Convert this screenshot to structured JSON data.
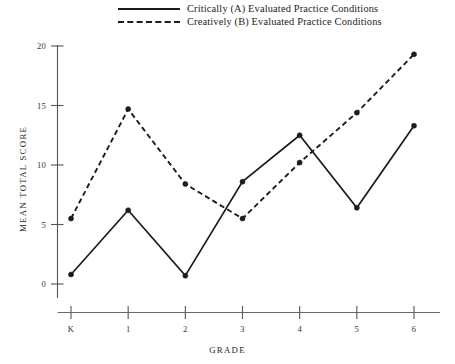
{
  "figure": {
    "background_color": "#ffffff",
    "ink_color": "#1c1c1c",
    "axis_color": "#555555"
  },
  "legend": {
    "position": "top-center",
    "entries": [
      {
        "key": "solid-line-key",
        "label": "Critically (A)  Evaluated Practice Conditions"
      },
      {
        "key": "dashed-line-key",
        "label": "Creatively (B)  Evaluated Practice Conditions"
      }
    ]
  },
  "axes": {
    "x_title": "GRADE",
    "y_title": "MEAN TOTAL SCORE",
    "x_ticks": [
      "K",
      "1",
      "2",
      "3",
      "4",
      "5",
      "6"
    ],
    "y_ticks": [
      "0",
      "5",
      "10",
      "15",
      "20"
    ]
  },
  "chart_data": {
    "type": "line",
    "title": "",
    "subtitle": "",
    "xlabel": "GRADE",
    "ylabel": "MEAN TOTAL SCORE",
    "categories": [
      "K",
      "1",
      "2",
      "3",
      "4",
      "5",
      "6"
    ],
    "x": [
      0,
      1,
      2,
      3,
      4,
      5,
      6
    ],
    "xlim": [
      0,
      6
    ],
    "ylim": [
      0,
      20
    ],
    "y_ticks": [
      0,
      5,
      10,
      15,
      20
    ],
    "grid": false,
    "legend_position": "top-center",
    "markers": "filled-circle",
    "series": [
      {
        "name": "Critically (A)  Evaluated Practice Conditions",
        "style": "solid",
        "color": "#1c1c1c",
        "values": [
          0.8,
          6.2,
          0.7,
          8.6,
          12.5,
          6.4,
          13.3
        ]
      },
      {
        "name": "Creatively (B)  Evaluated Practice Conditions",
        "style": "dashed",
        "color": "#1c1c1c",
        "values": [
          5.5,
          14.7,
          8.4,
          5.5,
          10.2,
          14.4,
          19.3
        ]
      }
    ]
  }
}
